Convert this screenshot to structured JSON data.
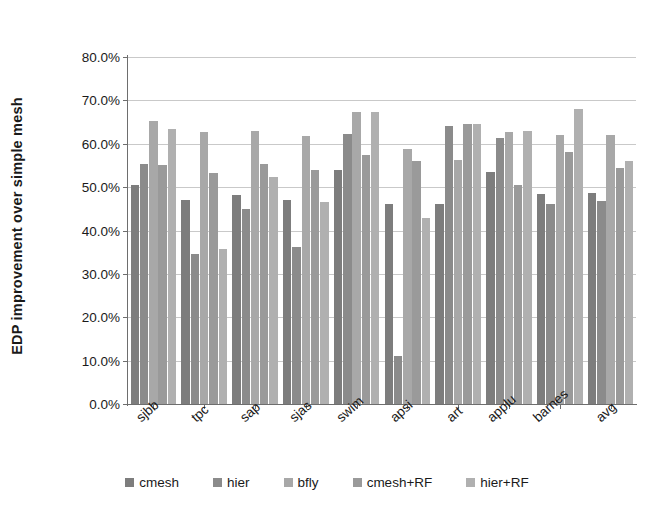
{
  "chart_data": {
    "type": "bar",
    "title": "",
    "xlabel": "",
    "ylabel": "EDP improvement over simple mesh",
    "ylim": [
      0,
      80
    ],
    "ytick_step": 10,
    "ytick_labels": [
      "80.0%",
      "70.0%",
      "60.0%",
      "50.0%",
      "40.0%",
      "30.0%",
      "20.0%",
      "10.0%",
      "0.0%"
    ],
    "ytick_values": [
      80,
      70,
      60,
      50,
      40,
      30,
      20,
      10,
      0
    ],
    "grid": true,
    "legend_position": "bottom",
    "categories": [
      "sjbb",
      "tpc",
      "sap",
      "sjas",
      "swim",
      "apsi",
      "art",
      "applu",
      "barnes",
      "avg"
    ],
    "series": [
      {
        "name": "cmesh",
        "color": "#7d7d7d",
        "values": [
          50.5,
          47.0,
          48.2,
          47.0,
          54.0,
          46.0,
          46.0,
          53.4,
          48.5,
          48.7
        ]
      },
      {
        "name": "hier",
        "color": "#8b8b8b",
        "values": [
          55.3,
          34.7,
          45.0,
          36.3,
          62.3,
          11.0,
          64.2,
          61.4,
          46.0,
          46.7
        ]
      },
      {
        "name": "bfly",
        "color": "#a8a8a8",
        "values": [
          65.2,
          62.8,
          63.0,
          61.7,
          67.3,
          58.7,
          56.3,
          62.8,
          62.0,
          62.0
        ]
      },
      {
        "name": "cmesh+RF",
        "color": "#9a9a9a",
        "values": [
          55.0,
          53.2,
          55.4,
          54.0,
          57.3,
          56.0,
          64.5,
          50.5,
          58.0,
          54.5
        ]
      },
      {
        "name": "hier+RF",
        "color": "#b0b0b0",
        "values": [
          63.5,
          35.8,
          52.3,
          46.6,
          67.3,
          42.8,
          64.5,
          63.0,
          68.0,
          56.0
        ]
      }
    ]
  }
}
